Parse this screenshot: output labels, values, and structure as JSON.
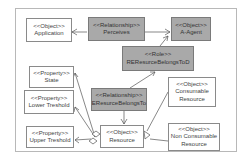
{
  "diagram": {
    "colors": {
      "frame_border": "#b8b8b8",
      "box_border": "#8a8a8a",
      "shaded_fill": "#a9a9a9",
      "plain_fill": "#ffffff",
      "text": "#444444",
      "edge": "#555555"
    },
    "nodes": {
      "application": {
        "stereotype": "<<Object>>",
        "name": "Application",
        "shaded": false
      },
      "perceives": {
        "stereotype": "<<Relationship>>",
        "name": "Perceives",
        "shaded": true
      },
      "a_agent": {
        "stereotype": "<<Object>>",
        "name": "A-Agent",
        "shaded": true
      },
      "role": {
        "stereotype": "<<Role>>",
        "name": "REResurceBelongsToD",
        "shaded": true
      },
      "state": {
        "stereotype": "<<Property>>",
        "name": "State",
        "shaded": false
      },
      "lower_treshold": {
        "stereotype": "<<Property>>",
        "name": "Lower Treshold",
        "shaded": false
      },
      "upper_treshold": {
        "stereotype": "<<Property>>",
        "name": "Upper Treshold",
        "shaded": false
      },
      "belongs_to": {
        "stereotype": "<<Relationship>>",
        "name": "EResurceBelongsTo",
        "shaded": true
      },
      "resource": {
        "stereotype": "<<Object>>",
        "name": "Resource",
        "shaded": false
      },
      "consumable": {
        "stereotype": "<<Object>>",
        "name_line1": "Consumable",
        "name_line2": "Resource",
        "shaded": false
      },
      "non_consumable": {
        "stereotype": "<<Object>>",
        "name_line1": "Non Consumable",
        "name_line2": "Resource",
        "shaded": false
      }
    },
    "edges": [
      {
        "from": "perceives",
        "to": "application",
        "type": "arrow"
      },
      {
        "from": "perceives",
        "to": "a_agent",
        "type": "arrow"
      },
      {
        "from": "role",
        "to": "a_agent",
        "type": "arrow"
      },
      {
        "from": "belongs_to",
        "to": "role",
        "type": "arrow"
      },
      {
        "from": "belongs_to",
        "to": "resource",
        "type": "arrow"
      },
      {
        "from": "resource",
        "to": "state",
        "type": "aggregation"
      },
      {
        "from": "resource",
        "to": "lower_treshold",
        "type": "aggregation"
      },
      {
        "from": "resource",
        "to": "upper_treshold",
        "type": "aggregation"
      },
      {
        "from": "consumable",
        "to": "resource",
        "type": "generalization"
      },
      {
        "from": "non_consumable",
        "to": "resource",
        "type": "generalization"
      }
    ]
  }
}
